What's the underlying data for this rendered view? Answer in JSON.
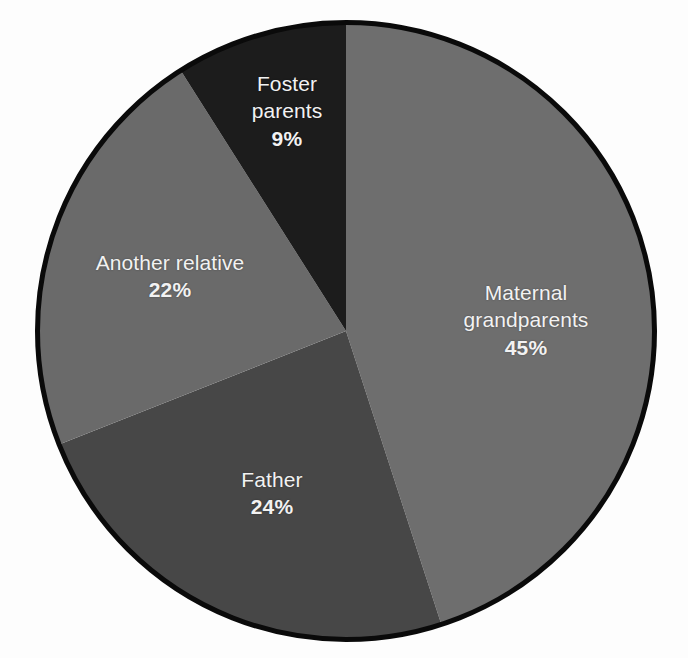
{
  "chart_data": {
    "type": "pie",
    "title": "",
    "subtitle": "",
    "xlabel": "",
    "ylabel": "",
    "grid": false,
    "legend_position": "none",
    "labels_inside_slices": true,
    "unit": "%",
    "total": 100,
    "start_angle_deg": 0,
    "direction": "clockwise",
    "categories": [
      "Maternal grandparents",
      "Father",
      "Another relative",
      "Foster parents"
    ],
    "values": [
      45,
      24,
      22,
      9
    ],
    "slices": [
      {
        "name": "Maternal grandparents",
        "label_line1": "Maternal",
        "label_line2": "grandparents",
        "value": 45,
        "value_text": "45%",
        "color": "#6e6e6e"
      },
      {
        "name": "Father",
        "label_line1": "Father",
        "label_line2": "",
        "value": 24,
        "value_text": "24%",
        "color": "#474747"
      },
      {
        "name": "Another relative",
        "label_line1": "Another relative",
        "label_line2": "",
        "value": 22,
        "value_text": "22%",
        "color": "#6a6a6a"
      },
      {
        "name": "Foster parents",
        "label_line1": "Foster",
        "label_line2": "parents",
        "value": 9,
        "value_text": "9%",
        "color": "#1c1c1c"
      }
    ],
    "style": {
      "background": "#fdfdfd",
      "outline_color": "#0a0a0a",
      "outline_width": 5,
      "label_text_color": "#f2f2f2"
    }
  }
}
